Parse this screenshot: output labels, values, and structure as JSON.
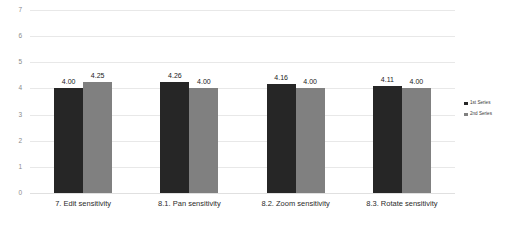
{
  "chart_data": {
    "type": "bar",
    "title": "",
    "subtitle": "",
    "xlabel": "",
    "ylabel": "",
    "ylim": [
      0,
      7
    ],
    "yticks": [
      0,
      1,
      2,
      3,
      4,
      5,
      6,
      7
    ],
    "grid": true,
    "legend_position": "right",
    "categories": [
      "7. Edit sensitivity",
      "8.1. Pan sensitivity",
      "8.2. Zoom sensitivity",
      "8.3. Rotate sensitivity"
    ],
    "series": [
      {
        "name": "1st Series",
        "color": "#262626",
        "values": [
          4.0,
          4.26,
          4.16,
          4.11
        ],
        "labels": [
          "4.00",
          "4.26",
          "4.16",
          "4.11"
        ]
      },
      {
        "name": "2nd Series",
        "color": "#808080",
        "values": [
          4.25,
          4.0,
          4.0,
          4.0
        ],
        "labels": [
          "4.25",
          "4.00",
          "4.00",
          "4.00"
        ]
      }
    ]
  },
  "axis": {
    "y_tick_labels": [
      "7",
      "6",
      "5",
      "4",
      "3",
      "2",
      "1",
      "0"
    ]
  },
  "legend": {
    "items": [
      {
        "label": "1st Series",
        "color": "#262626"
      },
      {
        "label": "2nd Series",
        "color": "#808080"
      }
    ]
  }
}
